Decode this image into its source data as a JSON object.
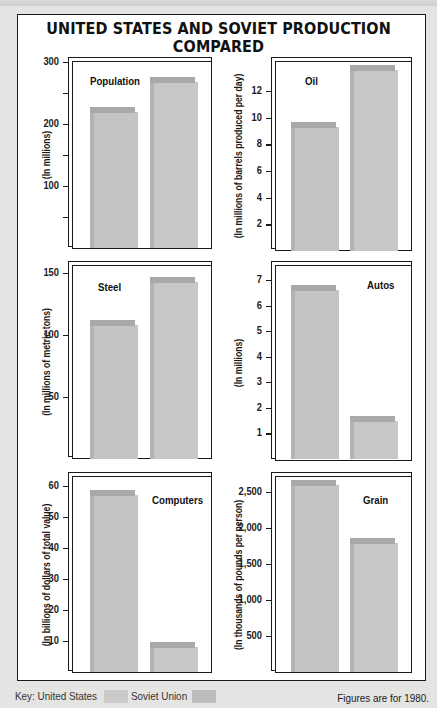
{
  "title": "UNITED STATES AND SOVIET PRODUCTION COMPARED",
  "legend": {
    "key_label": "Key:",
    "series": [
      {
        "name": "United States",
        "color": "#c9c9c9"
      },
      {
        "name": "Soviet Union",
        "color": "#bdbdbd"
      }
    ]
  },
  "footnote": "Figures are for 1980.",
  "colors": {
    "background": "#e4e4e2",
    "frame": "#1a1a1a",
    "bar_face": "#c4c4c4",
    "bar_cap": "#a9a9a9"
  },
  "chart_data": [
    {
      "type": "bar",
      "title": "Population",
      "ylabel": "(In millions)",
      "categories": [
        "United States",
        "Soviet Union"
      ],
      "values": [
        220,
        268
      ],
      "ylim": [
        0,
        300
      ],
      "yticks": [
        "100",
        "200",
        "300"
      ],
      "grid": false,
      "legend_position": "bottom"
    },
    {
      "type": "bar",
      "title": "Oil",
      "ylabel": "(In millions of barrels produced per day)",
      "categories": [
        "United States",
        "Soviet Union"
      ],
      "values": [
        9.3,
        13.6
      ],
      "ylim": [
        0,
        14
      ],
      "yticks": [
        "2",
        "4",
        "6",
        "8",
        "10",
        "12"
      ],
      "grid": false
    },
    {
      "type": "bar",
      "title": "Steel",
      "ylabel": "(In millions of metric tons)",
      "categories": [
        "United States",
        "Soviet Union"
      ],
      "values": [
        108,
        143
      ],
      "ylim": [
        0,
        150
      ],
      "yticks": [
        "50",
        "100",
        "150"
      ],
      "grid": false
    },
    {
      "type": "bar",
      "title": "Autos",
      "ylabel": "(In millions)",
      "categories": [
        "United States",
        "Soviet Union"
      ],
      "values": [
        6.6,
        1.5
      ],
      "ylim": [
        0,
        7
      ],
      "yticks": [
        "1",
        "2",
        "3",
        "4",
        "5",
        "6",
        "7"
      ],
      "grid": false
    },
    {
      "type": "bar",
      "title": "Computers",
      "ylabel": "(In billions of dollars of total value)",
      "categories": [
        "United States",
        "Soviet Union"
      ],
      "values": [
        57,
        8
      ],
      "ylim": [
        0,
        60
      ],
      "yticks": [
        "10",
        "20",
        "30",
        "40",
        "50",
        "60"
      ],
      "grid": false
    },
    {
      "type": "bar",
      "title": "Grain",
      "ylabel": "(In thousands of pounds per person)",
      "categories": [
        "United States",
        "Soviet Union"
      ],
      "values": [
        2600,
        1790
      ],
      "ylim": [
        0,
        2500
      ],
      "yticks": [
        "500",
        "1,000",
        "1,500",
        "2,000",
        "2,500"
      ],
      "grid": false
    }
  ]
}
